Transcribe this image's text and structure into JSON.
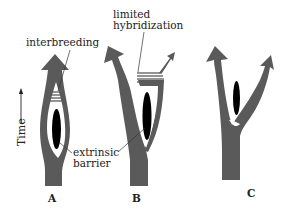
{
  "diagram": {
    "type": "speciation-modes",
    "colors": {
      "lineage": "#5a5a5a",
      "barrier": "#000000",
      "gap": "#ffffff",
      "text": "#222222",
      "leader": "#333333"
    },
    "axis": {
      "label": "Time",
      "direction": "up"
    },
    "panels": [
      {
        "id": "A",
        "letter": "A",
        "annotations": [
          "interbreeding",
          "extrinsic barrier"
        ],
        "description": "Lineage splits around barrier then rejoins (interbreeding)"
      },
      {
        "id": "B",
        "letter": "B",
        "annotations": [
          "limited hybridization"
        ],
        "description": "Two branches with limited hybridization zone above barrier"
      },
      {
        "id": "C",
        "letter": "C",
        "annotations": [],
        "description": "Complete divergence into two separate lineages"
      }
    ],
    "labels": {
      "interbreeding": "interbreeding",
      "limited_line1": "limited",
      "limited_line2": "hybridization",
      "extrinsic_line1": "extrinsic",
      "extrinsic_line2": "barrier"
    }
  }
}
